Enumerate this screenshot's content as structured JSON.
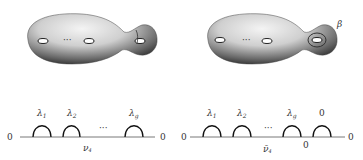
{
  "left_surface": {
    "dots": "···",
    "handle_label": "λ"
  },
  "right_surface": {
    "dots": "···",
    "curve_label": "β"
  },
  "left_graph": {
    "end_left": "0",
    "end_right": "0",
    "arcs": [
      {
        "label": "λ",
        "sub": "1"
      },
      {
        "label": "λ",
        "sub": "2"
      },
      {
        "label": "λ",
        "sub": "g"
      }
    ],
    "dots": "···",
    "edge_label": "ν",
    "edge_sub": "4"
  },
  "right_graph": {
    "end_left": "0",
    "end_right": "0",
    "arcs": [
      {
        "label": "λ",
        "sub": "1"
      },
      {
        "label": "λ",
        "sub": "2"
      },
      {
        "label": "λ",
        "sub": "g"
      },
      {
        "label": "0",
        "sub": ""
      }
    ],
    "dots": "···",
    "edge_label": "ν̄",
    "edge_sub": "4",
    "bottom_zero": "0"
  }
}
